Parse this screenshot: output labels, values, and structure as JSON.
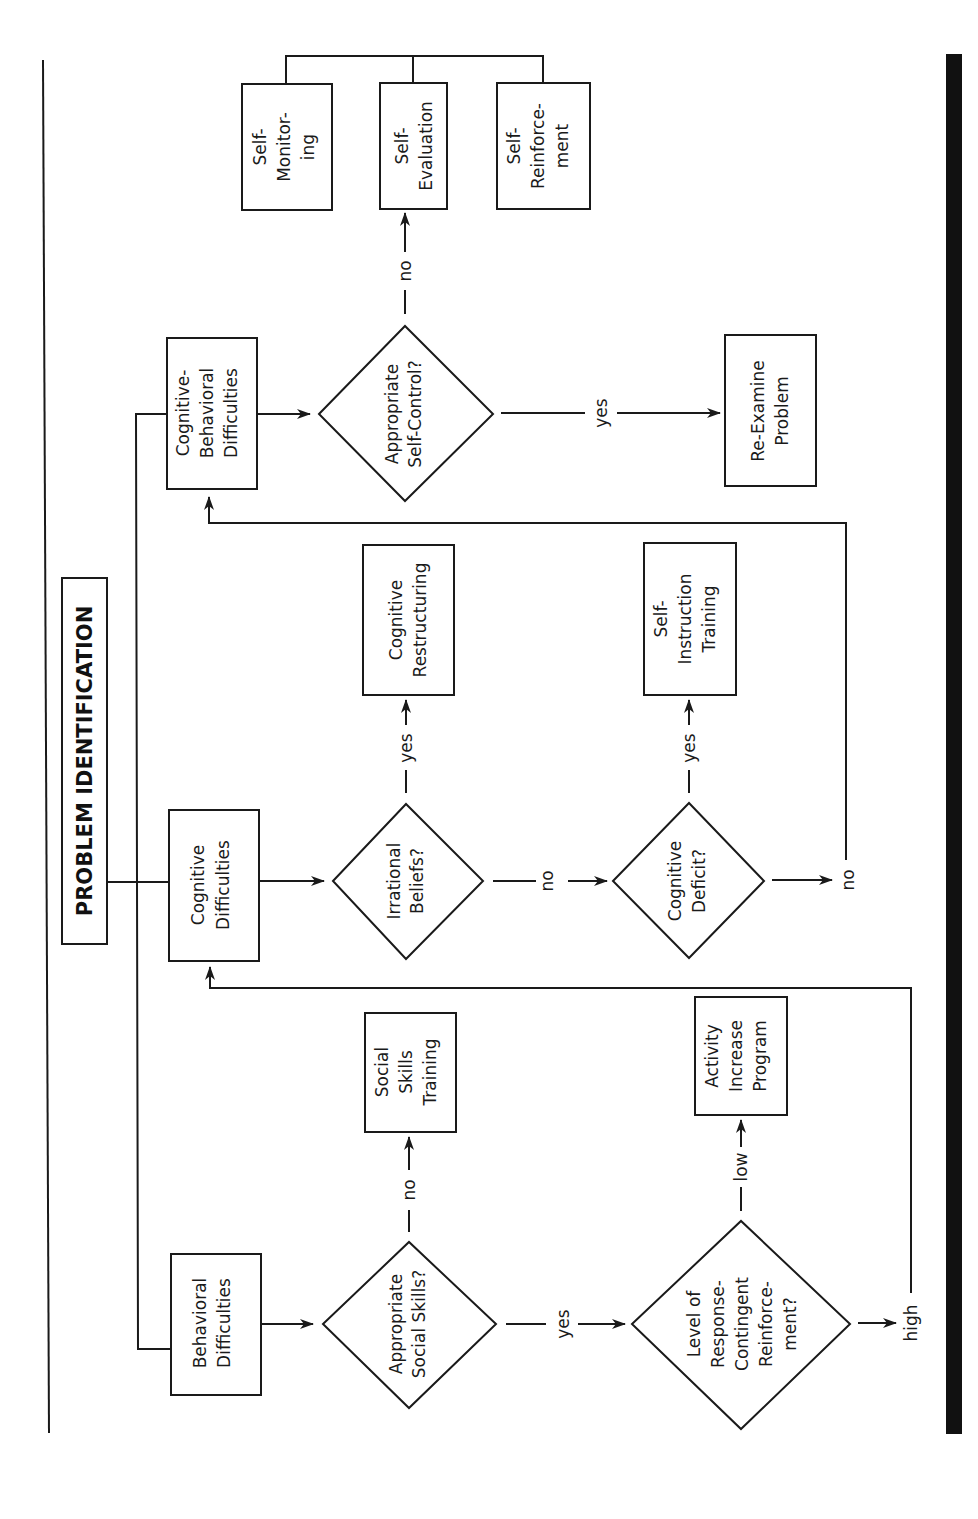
{
  "title": "PROBLEM IDENTIFICATION",
  "categories": {
    "behavioral": [
      "Behavioral",
      "Difficulties"
    ],
    "cognitive": [
      "Cognitive",
      "Difficulties"
    ],
    "cognitive_behavioral": [
      "Cognitive-",
      "Behavioral",
      "Difficulties"
    ]
  },
  "decisions": {
    "social_skills": [
      "Appropriate",
      "Social Skills?"
    ],
    "reinforcement": [
      "Level of",
      "Response-",
      "Contingent",
      "Reinforce-",
      "ment?"
    ],
    "irrational_beliefs": [
      "Irrational",
      "Beliefs?"
    ],
    "cognitive_deficit": [
      "Cognitive",
      "Deficit?"
    ],
    "self_control": [
      "Appropriate",
      "Self-Control?"
    ]
  },
  "interventions": {
    "social_skills_training": [
      "Social",
      "Skills",
      "Training"
    ],
    "activity_increase": [
      "Activity",
      "Increase",
      "Program"
    ],
    "cognitive_restructuring": [
      "Cognitive",
      "Restructuring"
    ],
    "self_instruction": [
      "Self-",
      "Instruction",
      "Training"
    ],
    "re_examine": [
      "Re-Examine",
      "Problem"
    ],
    "self_monitoring": [
      "Self-",
      "Monitor-",
      "ing"
    ],
    "self_evaluation": [
      "Self-",
      "Evaluation"
    ],
    "self_reinforcement": [
      "Self-",
      "Reinforce-",
      "ment"
    ]
  },
  "edge_labels": {
    "social_no": "no",
    "social_yes": "yes",
    "reinf_low": "low",
    "reinf_high": "high",
    "irr_yes": "yes",
    "irr_no": "no",
    "def_yes": "yes",
    "def_no": "no",
    "selfctrl_no": "no",
    "selfctrl_yes": "yes"
  }
}
